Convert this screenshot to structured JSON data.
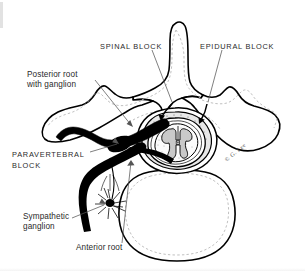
{
  "figure": {
    "background_color": "#ffffff",
    "ink_color": "#000000",
    "text_color": "#2a2a2a",
    "signature": "G. Lee"
  },
  "labels": {
    "spinal_block": "SPINAL BLOCK",
    "epidural_block": "EPIDURAL BLOCK",
    "posterior_root_line1": "Posterior root",
    "posterior_root_line2": "with ganglion",
    "paravertebral_line1": "PARAVERTEBRAL",
    "paravertebral_line2": "BLOCK",
    "sympathetic_line1": "Sympathetic",
    "sympathetic_line2": "ganglion",
    "anterior_root": "Anterior root"
  },
  "anatomy": {
    "spinous_process": "spinous-process",
    "transverse_process_left": "transverse-process-left",
    "transverse_process_right": "transverse-process-right",
    "vertebral_body": "vertebral-body",
    "spinal_canal": "spinal-canal",
    "spinal_cord": "spinal-cord",
    "gray_matter": "gray-matter-butterfly",
    "central_canal": "central-canal",
    "dura_mater": "dura-mater",
    "epidural_space": "epidural-space",
    "nerve_trunk": "nerve-trunk",
    "dorsal_root_ganglion": "dorsal-root-ganglion",
    "sympathetic_ganglion": "sympathetic-ganglion"
  }
}
